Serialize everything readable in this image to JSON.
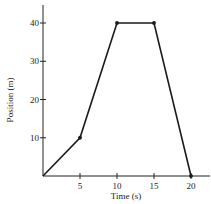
{
  "chart_data": {
    "type": "line",
    "title": "",
    "xlabel": "Time (s)",
    "ylabel": "Position (m)",
    "x": [
      0,
      5,
      10,
      15,
      20
    ],
    "series": [
      {
        "name": "position",
        "values": [
          0,
          10,
          40,
          40,
          0
        ]
      }
    ],
    "xticks": [
      "5",
      "10",
      "15",
      "20"
    ],
    "yticks": [
      "10",
      "20",
      "30",
      "40"
    ],
    "xlim": [
      0,
      22
    ],
    "ylim": [
      0,
      46
    ],
    "grid": false,
    "legend": null,
    "markers": true,
    "line_color": "#1a1a1a"
  }
}
